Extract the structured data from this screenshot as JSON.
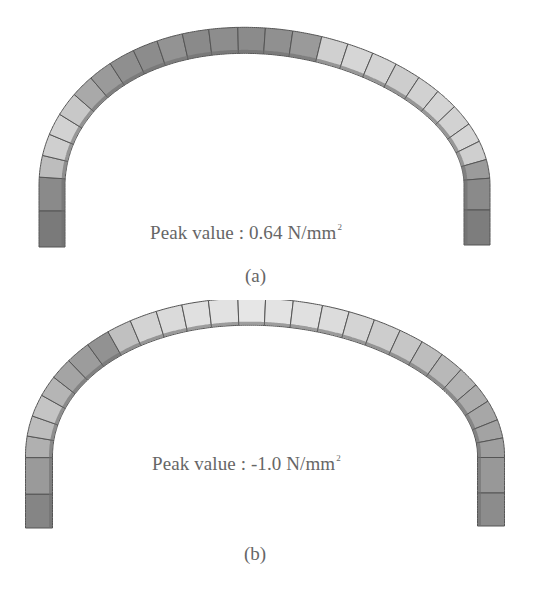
{
  "figure": {
    "panels": [
      {
        "id": "a",
        "caption": "(a)",
        "annotation": {
          "prefix": "Peak value : ",
          "value": "0.64",
          "unit": "N/mm",
          "unit_exponent": "2"
        },
        "arch": {
          "blocks": 28,
          "shading": [
            "#7a7a7a",
            "#8a8a8a",
            "#bdbdbd",
            "#cfcfcf",
            "#d2d2d2",
            "#c8c8c8",
            "#a9a9a9",
            "#9a9a9a",
            "#8f8f8f",
            "#8c8c8c",
            "#939393",
            "#8a8a8a",
            "#8d8d8d",
            "#8b8b8b",
            "#909090",
            "#9a9a9a",
            "#d0d0d0",
            "#d6d6d6",
            "#d3d3d3",
            "#cdcdcd",
            "#d1d1d1",
            "#d4d4d4",
            "#d2d2d2",
            "#d5d5d5",
            "#cfcfcf",
            "#9b9b9b",
            "#8a8a8a",
            "#7d7d7d"
          ]
        }
      },
      {
        "id": "b",
        "caption": "(b)",
        "annotation": {
          "prefix": "Peak value : ",
          "value": "-1.0",
          "unit": "N/mm",
          "unit_exponent": "2"
        },
        "arch": {
          "blocks": 30,
          "shading": [
            "#858585",
            "#9a9a9a",
            "#b0b0b0",
            "#bdbdbd",
            "#c4c4c4",
            "#b5b5b5",
            "#a4a4a4",
            "#9c9c9c",
            "#929292",
            "#c0c0c0",
            "#d3d3d3",
            "#dadada",
            "#e0e0e0",
            "#e2e2e2",
            "#e6e6e6",
            "#e3e3e3",
            "#e0e0e0",
            "#dcdcdc",
            "#d4d4d4",
            "#cdcdcd",
            "#c6c6c6",
            "#bdbdbd",
            "#b8b8b8",
            "#b3b3b3",
            "#acacac",
            "#a7a7a7",
            "#a3a3a3",
            "#9f9f9f",
            "#989898",
            "#8c8c8c"
          ]
        }
      }
    ]
  }
}
